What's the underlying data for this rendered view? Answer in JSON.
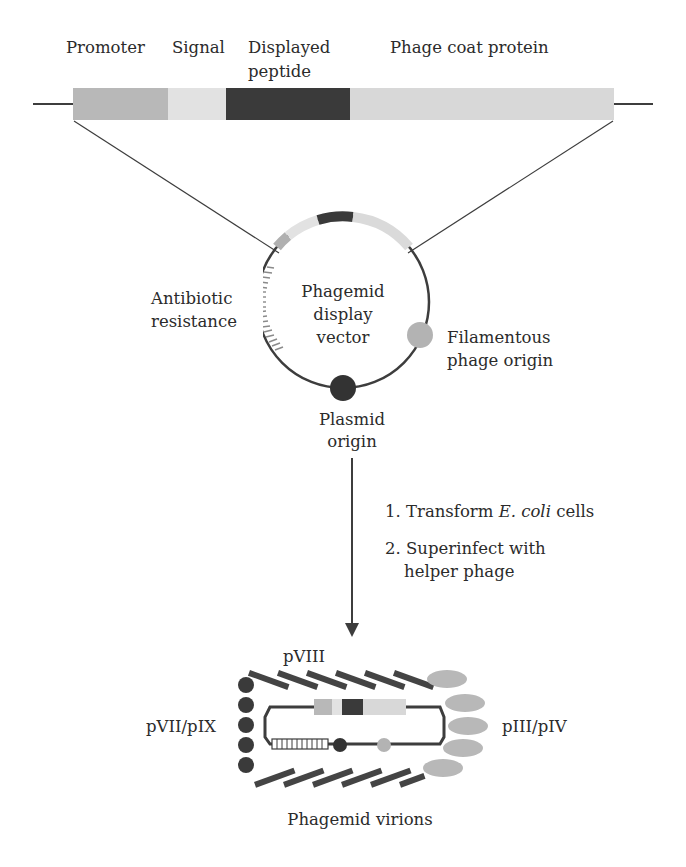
{
  "construct": {
    "labels": {
      "promoter": "Promoter",
      "signal": "Signal",
      "displayed_peptide_line1": "Displayed",
      "displayed_peptide_line2": "peptide",
      "phage_coat_protein": "Phage coat protein"
    },
    "segments": [
      {
        "name": "promoter",
        "color": "#b8b8b8"
      },
      {
        "name": "signal",
        "color": "#e2e2e2"
      },
      {
        "name": "displayed-peptide",
        "color": "#3a3a3a"
      },
      {
        "name": "phage-coat-protein",
        "color": "#d8d8d8"
      }
    ]
  },
  "vector": {
    "center_label_line1": "Phagemid",
    "center_label_line2": "display",
    "center_label_line3": "vector",
    "antibiotic_line1": "Antibiotic",
    "antibiotic_line2": "resistance",
    "filamentous_line1": "Filamentous",
    "filamentous_line2": "phage origin",
    "plasmid_line1": "Plasmid",
    "plasmid_line2": "origin"
  },
  "steps": {
    "step1_prefix": "1. Transform ",
    "step1_italic": "E. coli",
    "step1_suffix": " cells",
    "step2_line1": "2. Superinfect with",
    "step2_line2": "helper phage"
  },
  "virion": {
    "pviii_label": "pVIII",
    "pvii_pix_label": "pVII/pIX",
    "piii_piv_label": "pIII/pIV",
    "caption": "Phagemid virions"
  },
  "colors": {
    "line": "#3d3d3d",
    "dark": "#333333",
    "light_gray": "#b3b3b3",
    "pale_gray": "#d8d8d8"
  }
}
